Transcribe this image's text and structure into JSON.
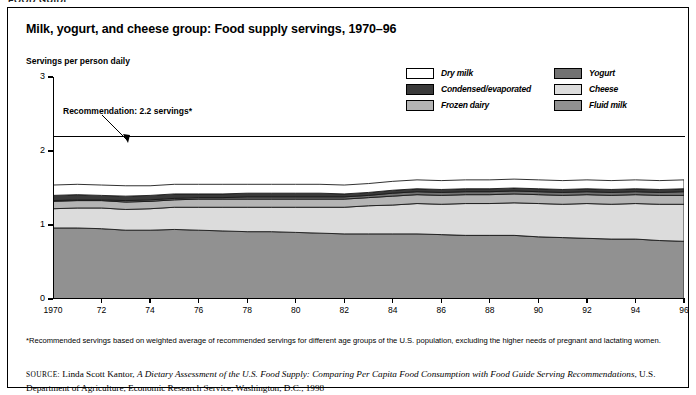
{
  "running_head": "FOOD GUIDE",
  "figure": {
    "title": "Milk, yogurt, and cheese group: Food supply servings, 1970–96",
    "y_axis_title": "Servings per person daily",
    "recommendation_label": "Recommendation: 2.2 servings*"
  },
  "legend": {
    "items": [
      {
        "label": "Dry milk",
        "color": "#ffffff"
      },
      {
        "label": "Yogurt",
        "color": "#727272"
      },
      {
        "label": "Condensed/evaporated",
        "color": "#3a3a3a"
      },
      {
        "label": "Cheese",
        "color": "#dcdcdc"
      },
      {
        "label": "Frozen dairy",
        "color": "#b4b4b4"
      },
      {
        "label": "Fluid milk",
        "color": "#919191"
      }
    ]
  },
  "footnote": "*Recommended servings based on weighted average of recommended servings for different age groups of the U.S. population, excluding the higher needs of pregnant and lactating women.",
  "source": {
    "prefix": "source:",
    "author": " Linda Scott Kantor, ",
    "title": "A Dietary Assessment of the U.S. Food Supply: Comparing Per Capita Food Consumption with Food Guide Serving Recommendations",
    "rest": ", U.S. Department of Agriculture, Economic Research Service, Washington, D.C., 1998"
  },
  "chart_data": {
    "type": "area",
    "title": "Milk, yogurt, and cheese group: Food supply servings, 1970–96",
    "xlabel": "",
    "ylabel": "Servings per person daily",
    "ylim": [
      0,
      3
    ],
    "xlim": [
      1970,
      1996
    ],
    "grid": false,
    "legend_position": "top-right",
    "stacked": true,
    "y_ticks": [
      0,
      1,
      2,
      3
    ],
    "y_tick_labels": [
      "0",
      "1",
      "2",
      "3"
    ],
    "x": [
      1970,
      1971,
      1972,
      1973,
      1974,
      1975,
      1976,
      1977,
      1978,
      1979,
      1980,
      1981,
      1982,
      1983,
      1984,
      1985,
      1986,
      1987,
      1988,
      1989,
      1990,
      1991,
      1992,
      1993,
      1994,
      1995,
      1996
    ],
    "x_ticks": [
      1970,
      1972,
      1974,
      1976,
      1978,
      1980,
      1982,
      1984,
      1986,
      1988,
      1990,
      1992,
      1994,
      1996
    ],
    "x_tick_labels": [
      "1970",
      "72",
      "74",
      "76",
      "78",
      "80",
      "82",
      "84",
      "86",
      "88",
      "90",
      "92",
      "94",
      "96"
    ],
    "annotations": [
      {
        "text": "Recommendation: 2.2 servings*",
        "y": 2.2,
        "type": "hline-with-arrow"
      }
    ],
    "series": [
      {
        "name": "Fluid milk",
        "color": "#919191",
        "values": [
          0.96,
          0.96,
          0.95,
          0.93,
          0.93,
          0.94,
          0.93,
          0.92,
          0.91,
          0.91,
          0.9,
          0.89,
          0.88,
          0.88,
          0.88,
          0.88,
          0.87,
          0.86,
          0.86,
          0.86,
          0.84,
          0.83,
          0.82,
          0.81,
          0.81,
          0.79,
          0.78
        ]
      },
      {
        "name": "Cheese",
        "color": "#dcdcdc",
        "values": [
          0.26,
          0.27,
          0.28,
          0.28,
          0.29,
          0.3,
          0.31,
          0.32,
          0.33,
          0.33,
          0.34,
          0.35,
          0.36,
          0.38,
          0.39,
          0.41,
          0.41,
          0.43,
          0.43,
          0.44,
          0.45,
          0.45,
          0.47,
          0.47,
          0.48,
          0.49,
          0.5
        ]
      },
      {
        "name": "Frozen dairy",
        "color": "#b4b4b4",
        "values": [
          0.1,
          0.1,
          0.1,
          0.1,
          0.1,
          0.1,
          0.11,
          0.11,
          0.11,
          0.11,
          0.11,
          0.11,
          0.11,
          0.11,
          0.12,
          0.12,
          0.12,
          0.12,
          0.12,
          0.12,
          0.12,
          0.12,
          0.12,
          0.12,
          0.12,
          0.12,
          0.12
        ]
      },
      {
        "name": "Yogurt",
        "color": "#727272",
        "values": [
          0.01,
          0.01,
          0.01,
          0.02,
          0.02,
          0.02,
          0.02,
          0.02,
          0.03,
          0.03,
          0.03,
          0.03,
          0.03,
          0.03,
          0.04,
          0.04,
          0.04,
          0.04,
          0.04,
          0.04,
          0.04,
          0.04,
          0.04,
          0.04,
          0.04,
          0.04,
          0.05
        ]
      },
      {
        "name": "Condensed/evaporated",
        "color": "#3a3a3a",
        "values": [
          0.07,
          0.07,
          0.06,
          0.06,
          0.06,
          0.06,
          0.05,
          0.05,
          0.05,
          0.05,
          0.05,
          0.05,
          0.04,
          0.04,
          0.04,
          0.04,
          0.04,
          0.04,
          0.04,
          0.04,
          0.04,
          0.04,
          0.04,
          0.04,
          0.04,
          0.04,
          0.04
        ]
      },
      {
        "name": "Dry milk",
        "color": "#ffffff",
        "values": [
          0.14,
          0.14,
          0.14,
          0.14,
          0.13,
          0.13,
          0.13,
          0.13,
          0.12,
          0.12,
          0.12,
          0.12,
          0.12,
          0.12,
          0.12,
          0.12,
          0.12,
          0.12,
          0.12,
          0.12,
          0.12,
          0.12,
          0.12,
          0.12,
          0.12,
          0.12,
          0.12
        ]
      }
    ],
    "totals": [
      1.54,
      1.55,
      1.54,
      1.53,
      1.53,
      1.55,
      1.55,
      1.55,
      1.55,
      1.55,
      1.55,
      1.55,
      1.54,
      1.56,
      1.59,
      1.61,
      1.6,
      1.61,
      1.61,
      1.62,
      1.61,
      1.6,
      1.61,
      1.6,
      1.61,
      1.6,
      1.61
    ]
  }
}
